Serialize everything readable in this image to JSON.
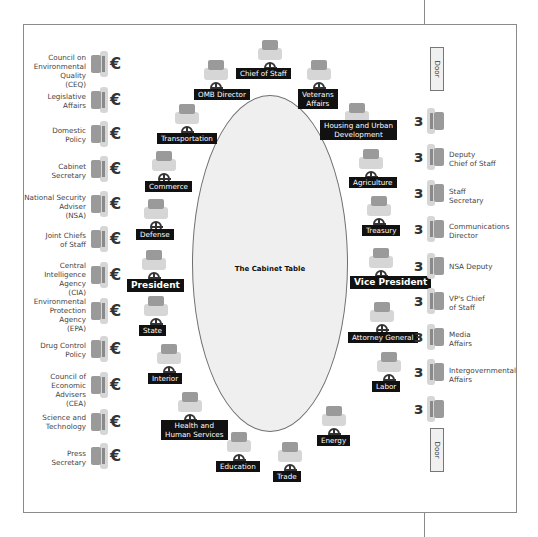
{
  "diagram": {
    "table_label": "The Cabinet Table",
    "door_label": "Door",
    "table_chairs": [
      {
        "id": "chief-of-staff",
        "label": "Chief of Staff",
        "chair": [
          256,
          40
        ],
        "lbl": [
          236,
          68
        ],
        "big": false
      },
      {
        "id": "omb-director",
        "label": "OMB Director",
        "chair": [
          202,
          60
        ],
        "lbl": [
          194,
          89
        ],
        "big": false
      },
      {
        "id": "veterans-affairs",
        "label": "Veterans\nAffairs",
        "chair": [
          305,
          60
        ],
        "lbl": [
          298,
          89
        ],
        "big": false
      },
      {
        "id": "transportation",
        "label": "Transportation",
        "chair": [
          173,
          104
        ],
        "lbl": [
          157,
          133
        ],
        "big": false
      },
      {
        "id": "housing-urban-development",
        "label": "Housing and Urban\nDevelopment",
        "chair": [
          343,
          103
        ],
        "lbl": [
          320,
          120
        ],
        "big": false
      },
      {
        "id": "commerce",
        "label": "Commerce",
        "chair": [
          150,
          151
        ],
        "lbl": [
          145,
          181
        ],
        "big": false
      },
      {
        "id": "agriculture",
        "label": "Agriculture",
        "chair": [
          357,
          149
        ],
        "lbl": [
          349,
          177
        ],
        "big": false
      },
      {
        "id": "defense",
        "label": "Defense",
        "chair": [
          142,
          199
        ],
        "lbl": [
          136,
          229
        ],
        "big": false
      },
      {
        "id": "treasury",
        "label": "Treasury",
        "chair": [
          365,
          196
        ],
        "lbl": [
          362,
          225
        ],
        "big": false
      },
      {
        "id": "president",
        "label": "President",
        "chair": [
          140,
          250
        ],
        "lbl": [
          127,
          279
        ],
        "big": true
      },
      {
        "id": "vice-president",
        "label": "Vice President",
        "chair": [
          367,
          248
        ],
        "lbl": [
          350,
          276
        ],
        "big": true
      },
      {
        "id": "state",
        "label": "State",
        "chair": [
          142,
          296
        ],
        "lbl": [
          139,
          325
        ],
        "big": false
      },
      {
        "id": "attorney-general",
        "label": "Attorney General",
        "chair": [
          368,
          302
        ],
        "lbl": [
          348,
          332
        ],
        "big": false
      },
      {
        "id": "interior",
        "label": "Interior",
        "chair": [
          155,
          344
        ],
        "lbl": [
          148,
          373
        ],
        "big": false
      },
      {
        "id": "labor",
        "label": "Labor",
        "chair": [
          375,
          352
        ],
        "lbl": [
          372,
          381
        ],
        "big": false
      },
      {
        "id": "health-human-services",
        "label": "Health and\nHuman Services",
        "chair": [
          176,
          392
        ],
        "lbl": [
          161,
          420
        ],
        "big": false
      },
      {
        "id": "energy",
        "label": "Energy",
        "chair": [
          320,
          406
        ],
        "lbl": [
          317,
          435
        ],
        "big": false
      },
      {
        "id": "education",
        "label": "Education",
        "chair": [
          225,
          432
        ],
        "lbl": [
          216,
          461
        ],
        "big": false
      },
      {
        "id": "trade",
        "label": "Trade",
        "chair": [
          276,
          442
        ],
        "lbl": [
          273,
          471
        ],
        "big": false
      }
    ],
    "left_wall": [
      {
        "id": "ceq",
        "label": "Council on\nEnvironmental\nQuality\n(CEQ)",
        "y": 51,
        "ty": 53
      },
      {
        "id": "legislative-affairs",
        "label": "Legislative\nAffairs",
        "y": 87,
        "ty": 92
      },
      {
        "id": "domestic-policy",
        "label": "Domestic\nPolicy",
        "y": 121,
        "ty": 126
      },
      {
        "id": "cabinet-secretary",
        "label": "Cabinet\nSecretary",
        "y": 156,
        "ty": 162
      },
      {
        "id": "nsa",
        "label": "National Security\nAdviser\n(NSA)",
        "y": 191,
        "ty": 193
      },
      {
        "id": "joint-chiefs",
        "label": "Joint Chiefs\nof Staff",
        "y": 226,
        "ty": 231
      },
      {
        "id": "cia",
        "label": "Central\nIntelligence\nAgency\n(CIA)",
        "y": 262,
        "ty": 261
      },
      {
        "id": "epa",
        "label": "Environmental\nProtection\nAgency\n(EPA)",
        "y": 298,
        "ty": 297
      },
      {
        "id": "drug-control",
        "label": "Drug Control\nPolicy",
        "y": 336,
        "ty": 341
      },
      {
        "id": "cea",
        "label": "Council of\nEconomic\nAdvisers\n(CEA)",
        "y": 372,
        "ty": 372
      },
      {
        "id": "science-technology",
        "label": "Science and\nTechnology",
        "y": 409,
        "ty": 413
      },
      {
        "id": "press-secretary",
        "label": "Press\nSecretary",
        "y": 443,
        "ty": 449
      }
    ],
    "right_wall": [
      {
        "id": "right-empty-1",
        "label": "",
        "y": 108,
        "ty": 112
      },
      {
        "id": "deputy-chief-of-staff",
        "label": "Deputy\nChief of Staff",
        "y": 144,
        "ty": 150
      },
      {
        "id": "staff-secretary",
        "label": "Staff\nSecretary",
        "y": 180,
        "ty": 187
      },
      {
        "id": "communications-director",
        "label": "Communications\nDirector",
        "y": 216,
        "ty": 222
      },
      {
        "id": "nsa-deputy",
        "label": "NSA Deputy",
        "y": 253,
        "ty": 262
      },
      {
        "id": "vps-chief-of-staff",
        "label": "VP's Chief\nof Staff",
        "y": 288,
        "ty": 294
      },
      {
        "id": "media-affairs",
        "label": "Media\nAffairs",
        "y": 324,
        "ty": 330
      },
      {
        "id": "intergovernmental-affairs",
        "label": "Intergovernmental\nAffairs",
        "y": 359,
        "ty": 366
      },
      {
        "id": "right-empty-2",
        "label": "",
        "y": 396,
        "ty": 400
      }
    ],
    "doors": [
      {
        "id": "door-top",
        "x": 430,
        "y": 47
      },
      {
        "id": "door-bottom",
        "x": 430,
        "y": 428
      }
    ]
  }
}
